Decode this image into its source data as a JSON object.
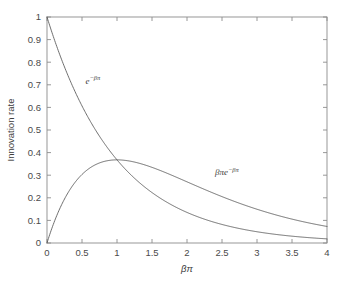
{
  "chart_data": {
    "type": "line",
    "title": "",
    "xlabel": "βπ",
    "ylabel": "Innovation rate",
    "xlim": [
      0,
      4
    ],
    "ylim": [
      0,
      1
    ],
    "grid": false,
    "legend": "inline-annotations",
    "xticks": [
      "0",
      "0.5",
      "1",
      "1.5",
      "2",
      "2.5",
      "3",
      "3.5",
      "4"
    ],
    "xtick_values": [
      0,
      0.5,
      1,
      1.5,
      2,
      2.5,
      3,
      3.5,
      4
    ],
    "yticks": [
      "0",
      "0.1",
      "0.2",
      "0.3",
      "0.4",
      "0.5",
      "0.6",
      "0.7",
      "0.8",
      "0.9",
      "1"
    ],
    "ytick_values": [
      0,
      0.1,
      0.2,
      0.3,
      0.4,
      0.5,
      0.6,
      0.7,
      0.8,
      0.9,
      1
    ],
    "x": [
      0,
      0.1,
      0.2,
      0.3,
      0.4,
      0.5,
      0.6,
      0.7,
      0.8,
      0.9,
      1,
      1.1,
      1.2,
      1.3,
      1.4,
      1.5,
      1.6,
      1.7,
      1.8,
      1.9,
      2,
      2.1,
      2.2,
      2.3,
      2.4,
      2.5,
      2.6,
      2.7,
      2.8,
      2.9,
      3,
      3.1,
      3.2,
      3.3,
      3.4,
      3.5,
      3.6,
      3.7,
      3.8,
      3.9,
      4
    ],
    "series": [
      {
        "name": "e^{-βπ}",
        "label_text": "e",
        "label_sup": "−βπ",
        "label_x": 0.55,
        "label_y": 0.705,
        "color": "#555555",
        "values": [
          1,
          0.905,
          0.819,
          0.741,
          0.67,
          0.607,
          0.549,
          0.497,
          0.449,
          0.407,
          0.368,
          0.333,
          0.301,
          0.273,
          0.247,
          0.223,
          0.202,
          0.183,
          0.165,
          0.15,
          0.135,
          0.122,
          0.111,
          0.1,
          0.091,
          0.082,
          0.074,
          0.067,
          0.061,
          0.055,
          0.05,
          0.045,
          0.041,
          0.037,
          0.033,
          0.03,
          0.027,
          0.025,
          0.022,
          0.02,
          0.018
        ]
      },
      {
        "name": "βπe^{-βπ}",
        "label_text": "βπe",
        "label_sup": "−βπ",
        "label_x": 2.4,
        "label_y": 0.3,
        "color": "#555555",
        "values": [
          0,
          0.09,
          0.164,
          0.222,
          0.268,
          0.303,
          0.329,
          0.348,
          0.359,
          0.366,
          0.368,
          0.366,
          0.361,
          0.354,
          0.345,
          0.335,
          0.323,
          0.311,
          0.298,
          0.284,
          0.271,
          0.257,
          0.244,
          0.231,
          0.218,
          0.205,
          0.193,
          0.181,
          0.17,
          0.16,
          0.149,
          0.14,
          0.131,
          0.122,
          0.114,
          0.106,
          0.098,
          0.091,
          0.085,
          0.079,
          0.073
        ]
      }
    ],
    "annotations": [
      {
        "text": "e^{-βπ}",
        "x": 0.55,
        "y": 0.705
      },
      {
        "text": "βπe^{-βπ}",
        "x": 2.4,
        "y": 0.3
      }
    ]
  }
}
